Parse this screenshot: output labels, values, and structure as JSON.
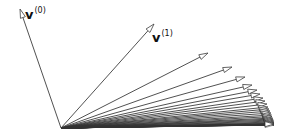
{
  "diagram": {
    "origin": [
      61,
      128
    ],
    "stroke_color": "#333333",
    "arrowhead_fill": "#ffffff",
    "labels": [
      {
        "id": "v0",
        "symbol": "v",
        "superscript": "(0)",
        "x": 25,
        "y": 6
      },
      {
        "id": "v1",
        "symbol": "v",
        "superscript": "(1)",
        "x": 152,
        "y": 29
      }
    ],
    "vectors": [
      [
        20,
        9
      ],
      [
        154,
        24
      ],
      [
        208,
        53
      ],
      [
        232,
        67
      ],
      [
        245,
        77
      ],
      [
        252,
        85
      ],
      [
        257,
        90
      ],
      [
        260,
        94
      ],
      [
        263,
        98
      ],
      [
        265,
        101
      ],
      [
        267,
        104
      ],
      [
        268,
        107
      ],
      [
        269,
        109
      ],
      [
        270,
        111
      ],
      [
        271,
        113
      ],
      [
        271.5,
        115
      ],
      [
        272,
        116.5
      ],
      [
        272.5,
        118
      ],
      [
        273,
        119
      ],
      [
        273.3,
        120
      ],
      [
        273.6,
        121
      ],
      [
        273.8,
        122
      ],
      [
        274,
        122.8
      ],
      [
        274,
        123.4
      ],
      [
        274,
        124
      ]
    ],
    "dense_tail_count": 40,
    "dense_tail_limit": [
      274,
      125
    ]
  }
}
